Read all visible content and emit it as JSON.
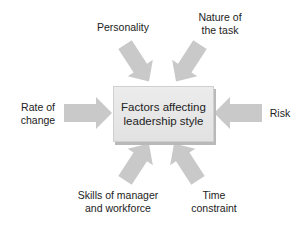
{
  "diagram": {
    "center": {
      "line1": "Factors affecting",
      "line2": "leadership style"
    },
    "factors": [
      {
        "id": "personality",
        "line1": "Personality",
        "line2": ""
      },
      {
        "id": "nature",
        "line1": "Nature of",
        "line2": "the task"
      },
      {
        "id": "rate",
        "line1": "Rate of",
        "line2": "change"
      },
      {
        "id": "risk",
        "line1": "Risk",
        "line2": ""
      },
      {
        "id": "skills",
        "line1": "Skills of manager",
        "line2": "and workforce"
      },
      {
        "id": "time",
        "line1": "Time",
        "line2": "constraint"
      }
    ],
    "colors": {
      "arrow": "#c8c8c8",
      "box": "#e6e6e6",
      "shadow": "#b9b9b9"
    }
  }
}
